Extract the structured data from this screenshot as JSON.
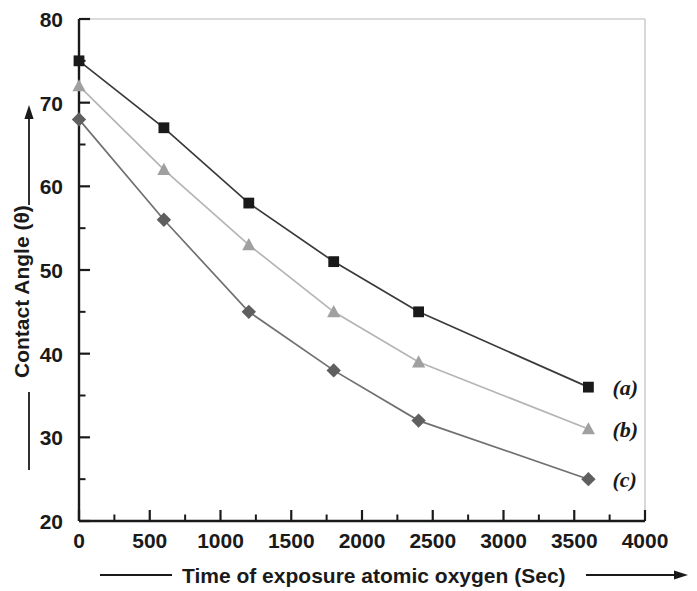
{
  "chart_data": {
    "type": "line",
    "title": "",
    "xlabel": "Time of exposure atomic oxygen (Sec)",
    "ylabel": "Contact Angle (θ)",
    "xlim": [
      0,
      4000
    ],
    "ylim": [
      20,
      80
    ],
    "grid": false,
    "legend_position": "right-of-plot-inline",
    "x_ticks": [
      "0",
      "500",
      "1000",
      "1500",
      "2000",
      "2500",
      "3000",
      "3500",
      "4000"
    ],
    "x_tick_values": [
      0,
      500,
      1000,
      1500,
      2000,
      2500,
      3000,
      3500,
      4000
    ],
    "y_ticks": [
      "20",
      "30",
      "40",
      "50",
      "60",
      "70",
      "80"
    ],
    "y_tick_values": [
      20,
      30,
      40,
      50,
      60,
      70,
      80
    ],
    "x": [
      0,
      600,
      1200,
      1800,
      2400,
      3600
    ],
    "series": [
      {
        "name": "(a)",
        "marker": "square",
        "color": "#1a1a1a",
        "line_color": "#3a3a3a",
        "values": [
          75,
          67,
          58,
          51,
          45,
          36
        ]
      },
      {
        "name": "(b)",
        "marker": "triangle",
        "color": "#a0a0a0",
        "line_color": "#b5b5b5",
        "values": [
          72,
          62,
          53,
          45,
          39,
          31
        ]
      },
      {
        "name": "(c)",
        "marker": "diamond",
        "color": "#5f5f5f",
        "line_color": "#707070",
        "values": [
          68,
          56,
          45,
          38,
          32,
          25
        ]
      }
    ]
  },
  "axes": {
    "y_axis_label": "Contact Angle (θ)",
    "x_axis_label": "Time of exposure atomic oxygen (Sec)"
  },
  "legend": {
    "entries": [
      {
        "label": "(a)"
      },
      {
        "label": "(b)"
      },
      {
        "label": "(c)"
      }
    ]
  },
  "colors": {
    "series_a": "#1a1a1a",
    "series_b": "#a0a0a0",
    "series_c": "#5f5f5f",
    "axis": "#1a1a1a",
    "frame_faint": "#cfcfcf",
    "background": "#ffffff"
  }
}
